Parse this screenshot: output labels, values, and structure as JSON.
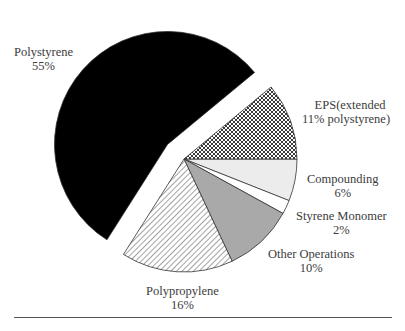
{
  "chart_data": {
    "type": "pie",
    "title": "",
    "exploded_slice": "Polystyrene",
    "slices": [
      {
        "label": "Polystyrene",
        "value": 55,
        "value_label": "55%",
        "fill": "#000000",
        "pattern": "solid"
      },
      {
        "label": "EPS(extended polystyrene)",
        "value": 11,
        "value_label": "11%",
        "fill": "#ffffff",
        "pattern": "crosshatch"
      },
      {
        "label": "Compounding",
        "value": 6,
        "value_label": "6%",
        "fill": "#ececec",
        "pattern": "solid"
      },
      {
        "label": "Styrene Monomer",
        "value": 2,
        "value_label": "2%",
        "fill": "#ffffff",
        "pattern": "solid"
      },
      {
        "label": "Other Operations",
        "value": 10,
        "value_label": "10%",
        "fill": "#a9a9a9",
        "pattern": "solid"
      },
      {
        "label": "Polypropylene",
        "value": 16,
        "value_label": "16%",
        "fill": "#ffffff",
        "pattern": "diagonal-hatch"
      }
    ]
  },
  "labels": {
    "polystyrene": {
      "name": "Polystyrene",
      "pct": "55%"
    },
    "eps": {
      "line1": "EPS(extended",
      "line2": "11% polystyrene)"
    },
    "compounding": {
      "name": "Compounding",
      "pct": "6%"
    },
    "styrene": {
      "name": "Styrene Monomer",
      "pct": "2%"
    },
    "other": {
      "name": "Other Operations",
      "pct": "10%"
    },
    "polypropylene": {
      "name": "Polypropylene",
      "pct": "16%"
    }
  }
}
